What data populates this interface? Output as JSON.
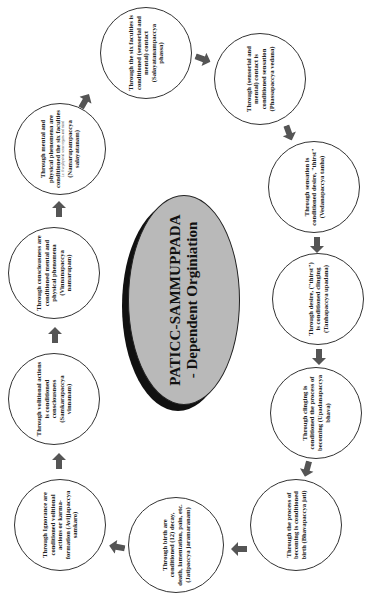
{
  "title": {
    "line1": "PATICC-SAMMUPPADA",
    "line2": "- Dependent Orginiation"
  },
  "colors": {
    "center_fill": "#b9b9b9",
    "center_shadow": "#111111",
    "arrow": "#555555",
    "circle_border": "#333333"
  },
  "nodes": [
    {
      "text": "Through Ignorance are conditioned volitional actions or karma-formation (Avijjapaccya samkaro)"
    },
    {
      "text": "Through volitional actions is conditioned consciousness (Samkarapaccya vinnanam)"
    },
    {
      "text": "Through consciousness are conditioned mental and physical phenomena (Vinnanapaccya namarupam)"
    },
    {
      "text": "Through mental and physical phenomena are conditioned the six faculties",
      "note": "i.e. five physical sense organs and mind",
      "text2": "(Namarupampaccya salayatanam)"
    },
    {
      "text": "Through the six faculties is conditioned (sensorial and mental) contact (Salayatanampaccya phassa)"
    },
    {
      "text": "Through (sensorial and mental) contact is conditioned sensation (Phassapaccya vedana)"
    },
    {
      "text": "Through sensation is conditioned desire, \"thirst\" (Vedanapaccya tanha)"
    },
    {
      "text": "Through desire, (\"thirst\") is conditioned clinging (Tanhapaccya upadana)"
    },
    {
      "text": "Through clinging is conditioned the process of becoming (Upadanapaccya bhava)"
    },
    {
      "text": "Through the process of becoming is conditioned birth (Bhavapaccya jati)"
    },
    {
      "text": "Through birth are conditioned (12) decay, death, lamentation, pain, etc. (Jatipaccya jaramaranam)"
    }
  ]
}
